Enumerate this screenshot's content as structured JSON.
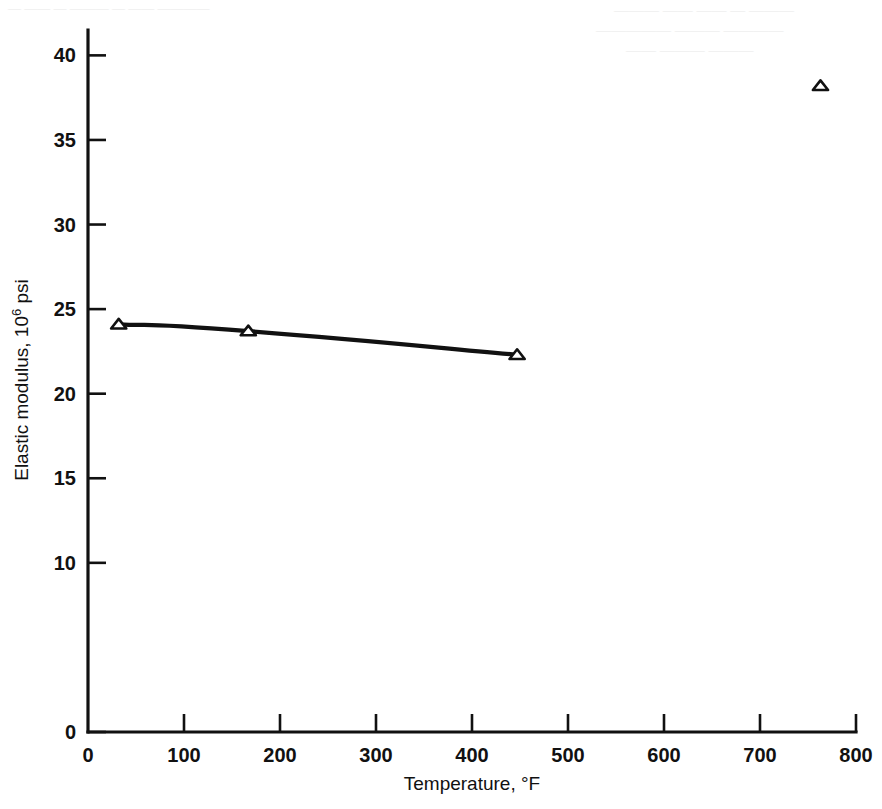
{
  "figure": {
    "background_color": "#ffffff",
    "ink_color": "#111111"
  },
  "artifacts": {
    "note": "faint illegible bleed-through text from reverse page",
    "lines": [
      {
        "text": "— —— — ——— — —— ————",
        "x": 8,
        "y": 2,
        "size": 13,
        "rotate": 0
      },
      {
        "text": "——— —— —— — ———",
        "x": 614,
        "y": 4,
        "size": 15,
        "rotate": 0
      },
      {
        "text": "————— ——— ————",
        "x": 596,
        "y": 24,
        "size": 15,
        "rotate": 0
      },
      {
        "text": "—— ——— ———",
        "x": 626,
        "y": 44,
        "size": 15,
        "rotate": 0
      }
    ]
  },
  "chart_data": {
    "type": "line",
    "title": "",
    "subtitle": "",
    "xlabel_text": "Temperature, ",
    "xlabel_unit": "°F",
    "ylabel_text": "Elastic modulus, 10",
    "ylabel_superscript": "6",
    "ylabel_suffix": " psi",
    "xlim": [
      0,
      800
    ],
    "ylim": [
      0,
      41.5
    ],
    "grid": false,
    "legend": null,
    "x_ticks": [
      0,
      100,
      200,
      300,
      400,
      500,
      600,
      700,
      800
    ],
    "x_tick_labels": [
      "0",
      "100",
      "200",
      "300",
      "400",
      "500",
      "600",
      "700",
      "800"
    ],
    "y_ticks": [
      0,
      10,
      15,
      20,
      25,
      30,
      35,
      40
    ],
    "y_tick_labels": [
      "0",
      "10",
      "15",
      "20",
      "25",
      "30",
      "35",
      "40"
    ],
    "series": [
      {
        "name": "elastic-modulus-curve",
        "marker": "triangle-up-open",
        "connected": true,
        "x": [
          32,
          167,
          447
        ],
        "y": [
          24.1,
          23.7,
          22.3
        ]
      },
      {
        "name": "isolated-high-temperature-point",
        "marker": "triangle-up-open",
        "connected": false,
        "x": [
          763
        ],
        "y": [
          38.2
        ]
      }
    ]
  }
}
